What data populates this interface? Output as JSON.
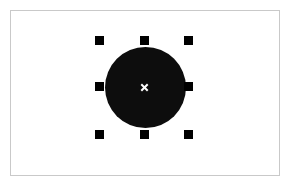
{
  "app": {
    "name": "vector-canvas",
    "background_color": "#ffffff"
  },
  "canvas": {
    "name": "artboard",
    "x": 10,
    "y": 10,
    "width": 270,
    "height": 166,
    "background_color": "#ffffff",
    "border_color": "#c9c9c9",
    "border_width": 1
  },
  "selection": {
    "label": "selection",
    "shape": {
      "type": "ellipse",
      "name": "filled-circle",
      "fill_color": "#0d0d0d",
      "x": 105,
      "y": 47,
      "width": 81,
      "height": 81,
      "center_x": 145,
      "center_y": 87,
      "radius": 40
    },
    "handle_color": "#000000",
    "handle_size": 9,
    "handles": [
      {
        "id": "nw",
        "label": "top-left-resize-handle",
        "x": 95,
        "y": 36
      },
      {
        "id": "n",
        "label": "top-center-resize-handle",
        "x": 140,
        "y": 36
      },
      {
        "id": "ne",
        "label": "top-right-resize-handle",
        "x": 184,
        "y": 36
      },
      {
        "id": "w",
        "label": "middle-left-resize-handle",
        "x": 95,
        "y": 82
      },
      {
        "id": "e",
        "label": "middle-right-resize-handle",
        "x": 184,
        "y": 82
      },
      {
        "id": "sw",
        "label": "bottom-left-resize-handle",
        "x": 95,
        "y": 130
      },
      {
        "id": "s",
        "label": "bottom-center-resize-handle",
        "x": 140,
        "y": 130
      },
      {
        "id": "se",
        "label": "bottom-right-resize-handle",
        "x": 184,
        "y": 130
      }
    ],
    "center_marker": {
      "name": "center-origin-marker",
      "glyph": "x",
      "color": "#ffffff",
      "x": 140,
      "y": 83,
      "size": 9
    }
  }
}
